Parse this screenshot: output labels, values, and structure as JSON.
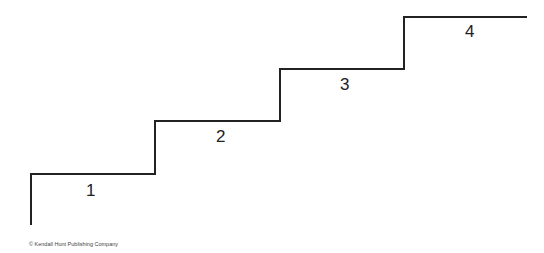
{
  "diagram": {
    "type": "staircase",
    "line_color": "#222222",
    "steps": [
      {
        "label": "1"
      },
      {
        "label": "2"
      },
      {
        "label": "3"
      },
      {
        "label": "4"
      }
    ]
  },
  "footer": {
    "copyright": "© Kendall Hunt Publishing Company"
  }
}
